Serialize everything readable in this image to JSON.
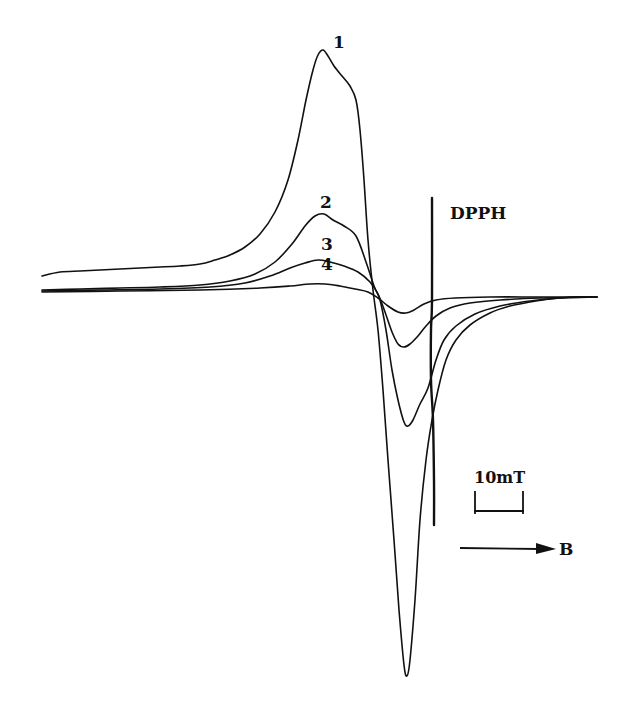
{
  "chart_data": {
    "type": "line",
    "title": "",
    "xlabel": "B",
    "ylabel": "",
    "x_direction_arrow": "B",
    "scale_bar": {
      "label": "10mT",
      "length_mT": 10
    },
    "reference_marker": {
      "label": "DPPH",
      "x": 433
    },
    "grid": false,
    "legend": "inline curve numbers",
    "series": [
      {
        "name": "1",
        "color": "#111111",
        "width": 1.6,
        "label_pos": [
          326,
          42
        ],
        "points": [
          [
            42,
            276
          ],
          [
            60,
            272
          ],
          [
            80,
            271
          ],
          [
            100,
            270
          ],
          [
            120,
            269
          ],
          [
            140,
            268
          ],
          [
            160,
            267
          ],
          [
            180,
            266
          ],
          [
            200,
            264
          ],
          [
            215,
            260
          ],
          [
            230,
            255
          ],
          [
            245,
            247
          ],
          [
            260,
            234
          ],
          [
            275,
            212
          ],
          [
            288,
            180
          ],
          [
            298,
            140
          ],
          [
            306,
            100
          ],
          [
            313,
            70
          ],
          [
            318,
            55
          ],
          [
            323,
            50
          ],
          [
            328,
            56
          ],
          [
            334,
            66
          ],
          [
            342,
            76
          ],
          [
            350,
            86
          ],
          [
            356,
            100
          ],
          [
            360,
            130
          ],
          [
            364,
            180
          ],
          [
            368,
            240
          ],
          [
            373,
            290
          ],
          [
            378,
            330
          ],
          [
            383,
            390
          ],
          [
            388,
            460
          ],
          [
            394,
            540
          ],
          [
            399,
            610
          ],
          [
            404,
            665
          ],
          [
            407,
            676
          ],
          [
            410,
            660
          ],
          [
            415,
            600
          ],
          [
            420,
            520
          ],
          [
            426,
            460
          ],
          [
            432,
            420
          ],
          [
            438,
            390
          ],
          [
            446,
            360
          ],
          [
            456,
            340
          ],
          [
            470,
            325
          ],
          [
            490,
            313
          ],
          [
            510,
            306
          ],
          [
            530,
            302
          ],
          [
            550,
            299
          ],
          [
            575,
            297
          ],
          [
            597,
            297
          ]
        ]
      },
      {
        "name": "2",
        "color": "#111111",
        "width": 1.6,
        "label_pos": [
          319,
          196
        ],
        "points": [
          [
            42,
            290
          ],
          [
            80,
            289
          ],
          [
            120,
            288
          ],
          [
            160,
            287
          ],
          [
            200,
            285
          ],
          [
            230,
            281
          ],
          [
            255,
            274
          ],
          [
            275,
            262
          ],
          [
            292,
            244
          ],
          [
            305,
            226
          ],
          [
            315,
            216
          ],
          [
            324,
            214
          ],
          [
            333,
            220
          ],
          [
            344,
            226
          ],
          [
            356,
            236
          ],
          [
            366,
            262
          ],
          [
            374,
            286
          ],
          [
            380,
            300
          ],
          [
            386,
            330
          ],
          [
            392,
            370
          ],
          [
            398,
            400
          ],
          [
            404,
            422
          ],
          [
            408,
            426
          ],
          [
            413,
            420
          ],
          [
            420,
            404
          ],
          [
            428,
            388
          ],
          [
            436,
            360
          ],
          [
            444,
            340
          ],
          [
            456,
            326
          ],
          [
            475,
            314
          ],
          [
            500,
            306
          ],
          [
            530,
            301
          ],
          [
            560,
            298
          ],
          [
            597,
            297
          ]
        ]
      },
      {
        "name": "3",
        "color": "#111111",
        "width": 1.6,
        "label_pos": [
          320,
          238
        ],
        "points": [
          [
            42,
            291
          ],
          [
            100,
            290
          ],
          [
            160,
            289
          ],
          [
            210,
            287
          ],
          [
            245,
            283
          ],
          [
            270,
            276
          ],
          [
            290,
            268
          ],
          [
            305,
            263
          ],
          [
            318,
            260
          ],
          [
            330,
            262
          ],
          [
            344,
            266
          ],
          [
            358,
            272
          ],
          [
            370,
            282
          ],
          [
            378,
            294
          ],
          [
            385,
            312
          ],
          [
            392,
            332
          ],
          [
            398,
            344
          ],
          [
            404,
            347
          ],
          [
            410,
            344
          ],
          [
            418,
            336
          ],
          [
            426,
            326
          ],
          [
            436,
            316
          ],
          [
            450,
            308
          ],
          [
            470,
            303
          ],
          [
            500,
            300
          ],
          [
            540,
            298
          ],
          [
            597,
            297
          ]
        ]
      },
      {
        "name": "4",
        "color": "#111111",
        "width": 1.6,
        "label_pos": [
          320,
          259
        ],
        "points": [
          [
            42,
            292
          ],
          [
            120,
            291
          ],
          [
            200,
            290
          ],
          [
            260,
            288
          ],
          [
            290,
            286
          ],
          [
            310,
            284
          ],
          [
            325,
            284
          ],
          [
            340,
            286
          ],
          [
            355,
            289
          ],
          [
            368,
            292
          ],
          [
            378,
            298
          ],
          [
            388,
            306
          ],
          [
            398,
            312
          ],
          [
            406,
            313
          ],
          [
            414,
            310
          ],
          [
            424,
            304
          ],
          [
            436,
            300
          ],
          [
            455,
            298
          ],
          [
            490,
            297
          ],
          [
            540,
            297
          ],
          [
            597,
            297
          ]
        ]
      },
      {
        "name": "DPPH",
        "color": "#111111",
        "width": 2.4,
        "label_pos": [
          450,
          204
        ],
        "points": [
          [
            432,
            198
          ],
          [
            432,
            300
          ],
          [
            431,
            330
          ],
          [
            431,
            380
          ],
          [
            433,
            420
          ],
          [
            434,
            480
          ],
          [
            434,
            525
          ]
        ]
      }
    ],
    "baseline_y": 293,
    "crossover_point": [
      377,
      292
    ]
  },
  "labels": {
    "curve_1": "1",
    "curve_2": "2",
    "curve_3": "3",
    "curve_4": "4",
    "dpph": "DPPH",
    "scale_bar": "10mT",
    "field_axis": "B"
  }
}
